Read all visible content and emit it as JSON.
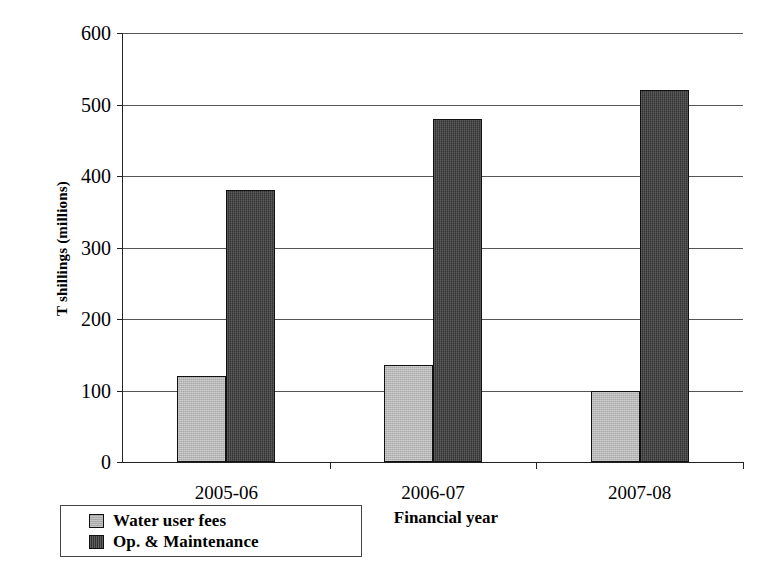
{
  "chart_data": {
    "type": "bar",
    "title": "",
    "subtitle": "",
    "categories": [
      "2005-06",
      "2006-07",
      "2007-08"
    ],
    "series": [
      {
        "name": "Water user fees",
        "values": [
          120,
          135,
          100
        ],
        "color": "#a9a9a9"
      },
      {
        "name": "Op. & Maintenance",
        "values": [
          380,
          480,
          520
        ],
        "color": "#333333"
      }
    ],
    "xlabel": "Financial year",
    "ylabel": "T shillings (millions)",
    "ylim": [
      0,
      600
    ],
    "ytick_values": [
      0,
      100,
      200,
      300,
      400,
      500,
      600
    ],
    "ytick_labels": [
      "0",
      "100",
      "200",
      "300",
      "400",
      "500",
      "600"
    ],
    "grid": true,
    "grid_axis": "y",
    "legend_position": "below-left",
    "legend_entries": [
      "Water user fees",
      "Op. & Maintenance"
    ],
    "annotations": []
  },
  "axes": {
    "y_title": "T shillings (millions)",
    "x_title": "Financial year"
  }
}
